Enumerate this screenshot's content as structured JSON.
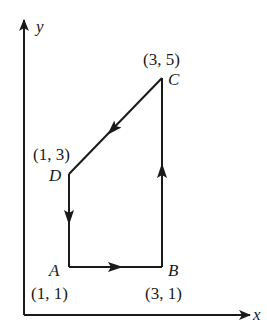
{
  "diagram": {
    "type": "pv-cycle",
    "axes": {
      "x_label": "x",
      "y_label": "y"
    },
    "points": {
      "A": {
        "name": "A",
        "coord": "(1, 1)"
      },
      "B": {
        "name": "B",
        "coord": "(3, 1)"
      },
      "C": {
        "name": "C",
        "coord": "(3, 5)"
      },
      "D": {
        "name": "D",
        "coord": "(1, 3)"
      }
    },
    "path": [
      "A",
      "B",
      "C",
      "D",
      "A"
    ],
    "colors": {
      "line": "#1a1a1a",
      "background": "#ffffff"
    }
  }
}
